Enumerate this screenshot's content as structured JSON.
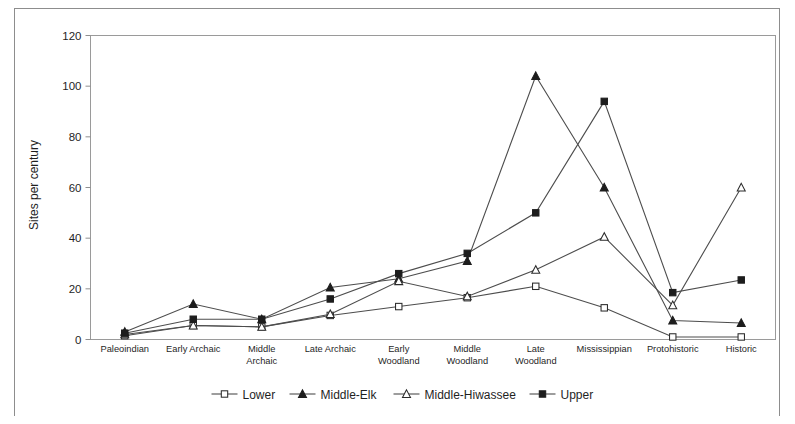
{
  "figure": {
    "background_color": "#ffffff",
    "frame_color": "#8d8d8d"
  },
  "chart_data": {
    "type": "line",
    "title": "",
    "xlabel": "",
    "ylabel": "Sites per century",
    "ylim": [
      0,
      120
    ],
    "yticks": [
      0,
      20,
      40,
      60,
      80,
      100,
      120
    ],
    "grid": false,
    "legend_position": "bottom",
    "categories": [
      "Paleoindian",
      "Early Archaic",
      "Middle Archaic",
      "Late Archaic",
      "Early Woodland",
      "Middle Woodland",
      "Late Woodland",
      "Mississippian",
      "Protohistoric",
      "Historic"
    ],
    "category_lines": [
      [
        "Paleoindian"
      ],
      [
        "Early Archaic"
      ],
      [
        "Middle",
        "Archaic"
      ],
      [
        "Late Archaic"
      ],
      [
        "Early",
        "Woodland"
      ],
      [
        "Middle",
        "Woodland"
      ],
      [
        "Late",
        "Woodland"
      ],
      [
        "Mississippian"
      ],
      [
        "Protohistoric"
      ],
      [
        "Historic"
      ]
    ],
    "series": [
      {
        "name": "Lower",
        "marker": "open-square",
        "color": "#4d4d4d",
        "values": [
          1.5,
          5.5,
          5,
          9.5,
          13,
          16.5,
          21,
          12.5,
          1,
          1
        ]
      },
      {
        "name": "Middle-Elk",
        "marker": "filled-triangle",
        "color": "#4d4d4d",
        "values": [
          3,
          14,
          8,
          20.5,
          24,
          31,
          104,
          60,
          7.5,
          6.5
        ]
      },
      {
        "name": "Middle-Hiwassee",
        "marker": "open-triangle",
        "color": "#4d4d4d",
        "values": [
          2,
          5.5,
          5,
          10,
          23,
          17,
          27.5,
          40.5,
          13.5,
          60
        ]
      },
      {
        "name": "Upper",
        "marker": "filled-square",
        "color": "#4d4d4d",
        "values": [
          2.5,
          8,
          8,
          16,
          26,
          34,
          50,
          94,
          18.5,
          23.5
        ]
      }
    ]
  },
  "legend": {
    "items": [
      {
        "label": "Lower",
        "marker": "open-square"
      },
      {
        "label": "Middle-Elk",
        "marker": "filled-triangle"
      },
      {
        "label": "Middle-Hiwassee",
        "marker": "open-triangle"
      },
      {
        "label": "Upper",
        "marker": "filled-square"
      }
    ]
  }
}
